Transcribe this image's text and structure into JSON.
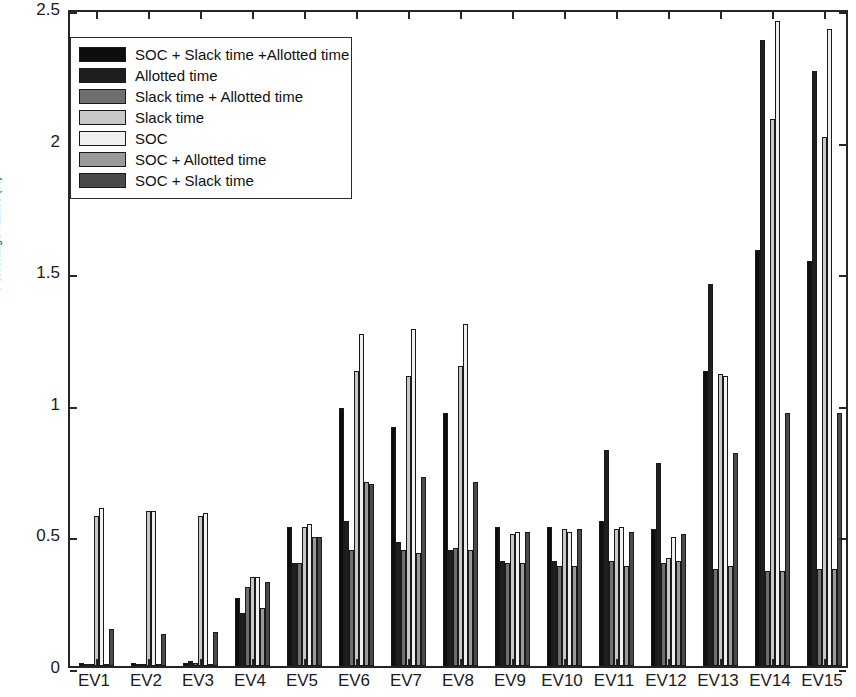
{
  "chart_data": {
    "type": "bar",
    "title": "",
    "subtitle": "",
    "xlabel": "",
    "ylabel": "Percentage Failure (%)",
    "ylim": [
      0,
      2.5
    ],
    "yticks": [
      0,
      0.5,
      1,
      1.5,
      2,
      2.5
    ],
    "ytick_labels": [
      "0",
      "0.5",
      "1",
      "1.5",
      "2",
      "2.5"
    ],
    "grid": false,
    "legend_position": "upper-left-inside",
    "categories": [
      "EV1",
      "EV2",
      "EV3",
      "EV4",
      "EV5",
      "EV6",
      "EV7",
      "EV8",
      "EV9",
      "EV10",
      "EV11",
      "EV12",
      "EV13",
      "EV14",
      "EV15"
    ],
    "series": [
      {
        "name": "SOC + Slack time +Allotted time",
        "color": "#0d0d0d",
        "values": [
          0.01,
          0.01,
          0.01,
          0.26,
          0.53,
          0.98,
          0.91,
          0.96,
          0.53,
          0.53,
          0.55,
          0.52,
          1.12,
          1.58,
          1.54
        ]
      },
      {
        "name": "Allotted time",
        "color": "#1f1f1f",
        "values": [
          0.005,
          0.005,
          0.02,
          0.2,
          0.39,
          0.55,
          0.47,
          0.44,
          0.4,
          0.4,
          0.82,
          0.77,
          1.45,
          2.38,
          2.26
        ]
      },
      {
        "name": "Slack time + Allotted time",
        "color": "#6e6e6e",
        "values": [
          0.005,
          0.005,
          0.01,
          0.3,
          0.39,
          0.44,
          0.44,
          0.45,
          0.39,
          0.38,
          0.4,
          0.39,
          0.37,
          0.36,
          0.37
        ]
      },
      {
        "name": "Slack time",
        "color": "#c8c8c8",
        "values": [
          0.57,
          0.59,
          0.57,
          0.34,
          0.53,
          1.12,
          1.1,
          1.14,
          0.5,
          0.52,
          0.52,
          0.41,
          1.11,
          2.08,
          2.01
        ]
      },
      {
        "name": "SOC",
        "color": "#f0f0f0",
        "values": [
          0.6,
          0.59,
          0.58,
          0.34,
          0.54,
          1.26,
          1.28,
          1.3,
          0.51,
          0.51,
          0.53,
          0.49,
          1.1,
          2.45,
          2.42
        ]
      },
      {
        "name": "SOC + Allotted time",
        "color": "#9a9a9a",
        "values": [
          0.005,
          0.005,
          0.005,
          0.22,
          0.49,
          0.7,
          0.43,
          0.44,
          0.39,
          0.38,
          0.38,
          0.4,
          0.38,
          0.36,
          0.37
        ]
      },
      {
        "name": "SOC + Slack time",
        "color": "#4a4a4a",
        "values": [
          0.14,
          0.12,
          0.13,
          0.32,
          0.49,
          0.69,
          0.72,
          0.7,
          0.51,
          0.52,
          0.51,
          0.5,
          0.81,
          0.96,
          0.96
        ]
      }
    ],
    "legend_entries": [
      "SOC + Slack time +Allotted time",
      "Allotted time",
      "Slack time + Allotted time",
      "Slack time",
      "SOC",
      "SOC + Allotted time",
      "SOC + Slack time"
    ]
  },
  "axes": {
    "y_title": "Percentage Failure (%)"
  }
}
